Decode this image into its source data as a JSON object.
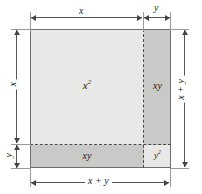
{
  "diagram": {
    "regions": [
      {
        "id": "x2",
        "label": "x",
        "exponent": "2",
        "area_expression": "x²",
        "fill": "#e8e8e6"
      },
      {
        "id": "xy_right",
        "label": "xy",
        "exponent": "",
        "area_expression": "xy",
        "fill": "#c9c9c7"
      },
      {
        "id": "xy_bottom",
        "label": "xy",
        "exponent": "",
        "area_expression": "xy",
        "fill": "#c9c9c7"
      },
      {
        "id": "y2",
        "label": "y",
        "exponent": "2",
        "area_expression": "y²",
        "fill": "#e8e8e6"
      }
    ],
    "dimensions": {
      "top_left": "x",
      "top_right": "y",
      "left_upper": "x",
      "left_lower": "y",
      "right_total": "x + y",
      "bottom_total": "x + y"
    },
    "colors": {
      "light_fill": "#e8e8e6",
      "dark_fill": "#c9c9c7",
      "outline": "#6e6e6e",
      "dashed": "#4a4a4a",
      "dimension_line": "#555555",
      "background": "#ffffff"
    }
  }
}
